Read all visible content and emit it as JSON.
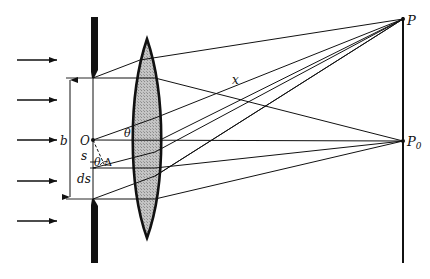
{
  "figure": {
    "type": "Fraunhofer single-slit diffraction optical diagram",
    "incident_arrows": 5,
    "labels": {
      "P": "P",
      "P0_main": "P",
      "P0_sub": "0",
      "O": "O",
      "b": "b",
      "s": "s",
      "ds": "ds",
      "theta_upper": "θ",
      "theta_lower": "θ",
      "delta": "Δ",
      "x": "x"
    },
    "colors": {
      "ink": "#111111",
      "lens_fill": "#b8b8b8",
      "background": "#ffffff"
    }
  }
}
